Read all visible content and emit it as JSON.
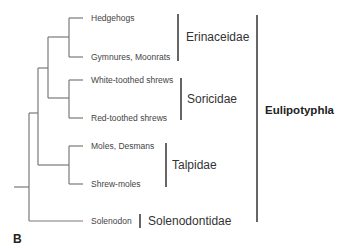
{
  "panel_label": "B",
  "order": {
    "label": "Eulipotyphla"
  },
  "families": [
    {
      "label": "Erinaceidae",
      "leaves": [
        "Hedgehogs",
        "Gymnures, Moonrats"
      ]
    },
    {
      "label": "Soricidae",
      "leaves": [
        "White-toothed shrews",
        "Red-toothed shrews"
      ]
    },
    {
      "label": "Talpidae",
      "leaves": [
        "Moles, Desmans",
        "Shrew-moles"
      ]
    },
    {
      "label": "Solenodontidae",
      "leaves": [
        "Solenodon"
      ]
    }
  ],
  "colors": {
    "line": "#777777",
    "text": "#333333"
  }
}
